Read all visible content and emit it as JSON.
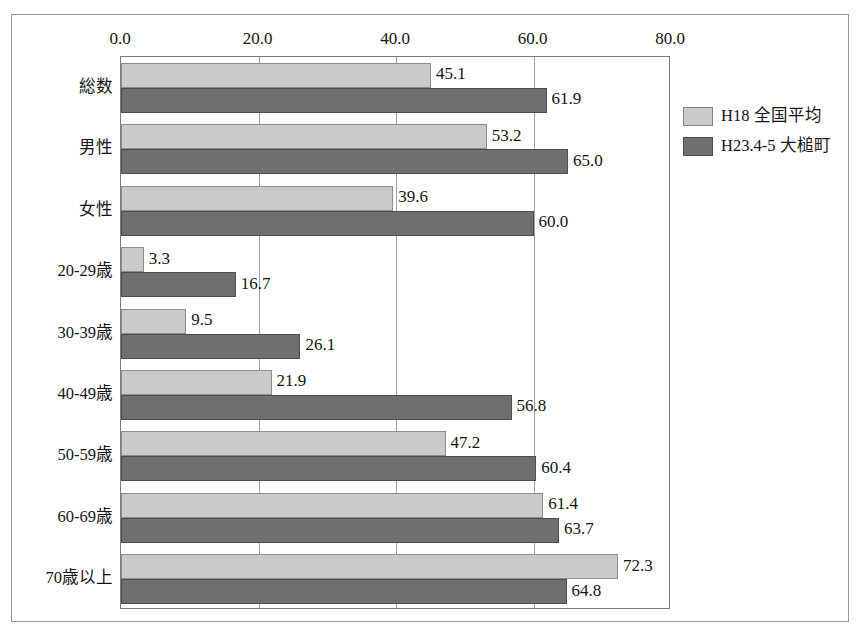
{
  "chart_data": {
    "type": "bar",
    "orientation": "horizontal",
    "title": "",
    "xlabel": "",
    "ylabel": "",
    "xlim": [
      0,
      80
    ],
    "xticks": [
      "0.0",
      "20.0",
      "40.0",
      "60.0",
      "80.0"
    ],
    "xtick_values": [
      0,
      20,
      40,
      60,
      80
    ],
    "grid": true,
    "legend_position": "right",
    "categories": [
      "総数",
      "男性",
      "女性",
      "20-29歳",
      "30-39歳",
      "40-49歳",
      "50-59歳",
      "60-69歳",
      "70歳以上"
    ],
    "series": [
      {
        "name": "H18 全国平均",
        "color": "#cacaca",
        "values": [
          45.1,
          53.2,
          39.6,
          3.3,
          9.5,
          21.9,
          47.2,
          61.4,
          72.3
        ],
        "labels": [
          "45.1",
          "53.2",
          "39.6",
          "3.3",
          "9.5",
          "21.9",
          "47.2",
          "61.4",
          "72.3"
        ]
      },
      {
        "name": "H23.4-5 大槌町",
        "color": "#6f6f6f",
        "values": [
          61.9,
          65.0,
          60.0,
          16.7,
          26.1,
          56.8,
          60.4,
          63.7,
          64.8
        ],
        "labels": [
          "61.9",
          "65.0",
          "60.0",
          "16.7",
          "26.1",
          "56.8",
          "60.4",
          "63.7",
          "64.8"
        ]
      }
    ]
  },
  "legend": {
    "items": [
      {
        "label": "H18 全国平均",
        "color": "#cacaca"
      },
      {
        "label": "H23.4-5 大槌町",
        "color": "#6f6f6f"
      }
    ]
  },
  "colors": {
    "series_light": "#cacaca",
    "series_dark": "#6f6f6f",
    "frame": "#9a9a9a",
    "gridline": "#a0a0a0",
    "text": "#141414",
    "background": "#ffffff"
  }
}
